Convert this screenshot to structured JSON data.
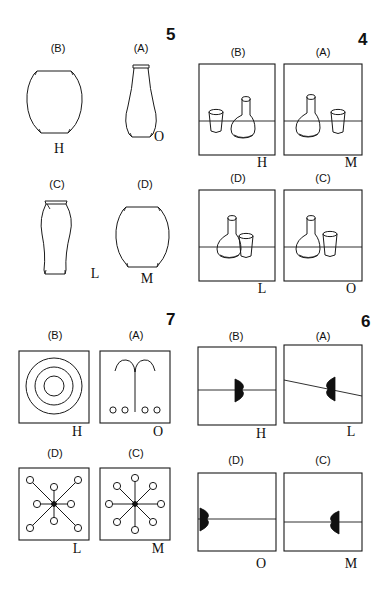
{
  "page": {
    "background_color": "#ffffff",
    "ink_color": "#1a1a1a",
    "width": 386,
    "height": 604
  },
  "items": [
    {
      "number": "5",
      "kind": "vase-outlines",
      "quadrant": "top-left",
      "cells": [
        {
          "option": "(B)",
          "key": "H",
          "shape": "wide-round-jar"
        },
        {
          "option": "(A)",
          "key": "O",
          "shape": "tall-slender-bottle"
        },
        {
          "option": "(C)",
          "key": "L",
          "shape": "bulb-top-long-stem"
        },
        {
          "option": "(D)",
          "key": "M",
          "shape": "wide-round-jar-flat-base"
        }
      ]
    },
    {
      "number": "4",
      "kind": "flask-and-cup-scenes",
      "quadrant": "top-right",
      "cells": [
        {
          "option": "(B)",
          "key": "H",
          "shape": "cup-left-far-flask-right",
          "horizon": "mid"
        },
        {
          "option": "(A)",
          "key": "M",
          "shape": "flask-left-cup-right",
          "horizon": "mid"
        },
        {
          "option": "(D)",
          "key": "L",
          "shape": "flask-left-cup-overlapping-right",
          "horizon": "mid"
        },
        {
          "option": "(C)",
          "key": "O",
          "shape": "flask-left-cup-adjacent-right",
          "horizon": "mid"
        }
      ]
    },
    {
      "number": "7",
      "kind": "radial-and-ring-patterns",
      "quadrant": "bottom-left",
      "cells": [
        {
          "option": "(B)",
          "key": "H",
          "shape": "three-concentric-circles",
          "rings": 3
        },
        {
          "option": "(A)",
          "key": "O",
          "shape": "fountain-arc-with-four-dots",
          "dots": 4
        },
        {
          "option": "(D)",
          "key": "L",
          "shape": "eight-spoke-star-long-diagonals",
          "spokes": 8
        },
        {
          "option": "(C)",
          "key": "M",
          "shape": "eight-spoke-star-equal-length",
          "spokes": 8
        }
      ]
    },
    {
      "number": "6",
      "kind": "half-disc-on-line",
      "quadrant": "bottom-right",
      "cells": [
        {
          "option": "(B)",
          "key": "H",
          "shape": "half-disc-center-bulge-right",
          "line": "horizontal-mid"
        },
        {
          "option": "(A)",
          "key": "L",
          "shape": "half-disc-center-bulge-left",
          "line": "sloped-down-right"
        },
        {
          "option": "(D)",
          "key": "O",
          "shape": "half-disc-left-edge-bulge-right",
          "line": "horizontal-lower"
        },
        {
          "option": "(C)",
          "key": "M",
          "shape": "half-disc-right-edge-bulge-left",
          "line": "horizontal-lower"
        }
      ]
    }
  ]
}
